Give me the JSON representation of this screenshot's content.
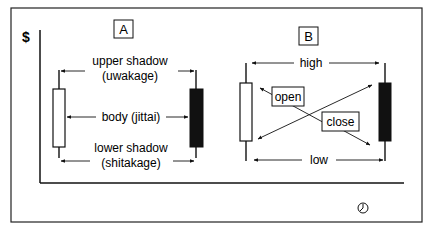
{
  "axis": {
    "y_label": "$",
    "time_icon": "clock-icon"
  },
  "panel_a": {
    "label": "A",
    "upper_shadow_line1": "upper shadow",
    "upper_shadow_line2": "(uwakage)",
    "body": "body (jittai)",
    "lower_shadow_line1": "lower shadow",
    "lower_shadow_line2": "(shitakage)"
  },
  "panel_b": {
    "label": "B",
    "high": "high",
    "open": "open",
    "close": "close",
    "low": "low"
  },
  "colors": {
    "ink": "#111111",
    "bullish_body": "#ffffff",
    "bearish_body": "#111111"
  }
}
